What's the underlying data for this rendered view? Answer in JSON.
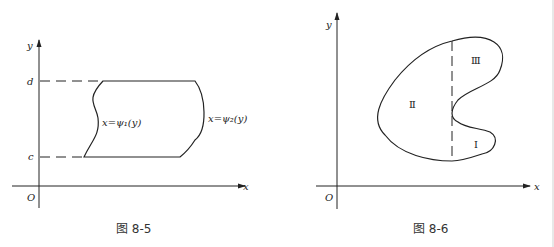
{
  "figures": [
    {
      "caption": "图 8-5",
      "axis_labels": {
        "x": "x",
        "y": "y",
        "origin": "O"
      },
      "levels": {
        "top": "d",
        "bottom": "c"
      },
      "curves": {
        "left": "x=ψ₁(y)",
        "right": "x=ψ₂(y)"
      }
    },
    {
      "caption": "图 8-6",
      "axis_labels": {
        "x": "x",
        "y": "y",
        "origin": "O"
      },
      "regions": {
        "one": "Ⅰ",
        "two": "Ⅱ",
        "three": "Ⅲ"
      }
    }
  ]
}
